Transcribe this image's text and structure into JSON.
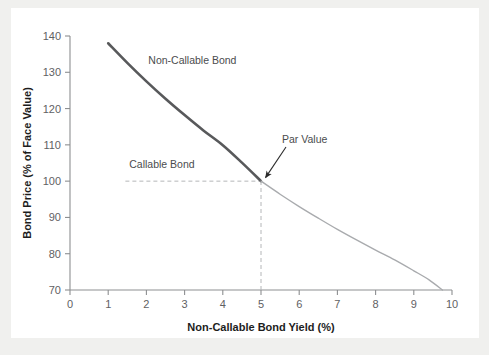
{
  "chart_data": {
    "type": "line",
    "title": "",
    "xlabel": "Non-Callable Bond Yield (%)",
    "ylabel": "Bond Price (% of Face Value)",
    "xlim": [
      0,
      10
    ],
    "ylim": [
      70,
      140
    ],
    "xticks": [
      "0",
      "1",
      "2",
      "3",
      "4",
      "5",
      "6",
      "7",
      "8",
      "9",
      "10"
    ],
    "yticks": [
      "70",
      "80",
      "90",
      "100",
      "110",
      "120",
      "130",
      "140"
    ],
    "grid": false,
    "legend_position": "inline-labels",
    "series": [
      {
        "name": "Non-Callable Bond",
        "color": "#58595b",
        "width": 2.6,
        "x": [
          1.0,
          1.5,
          2.0,
          2.5,
          3.0,
          3.5,
          4.0,
          4.5,
          5.0
        ],
        "y": [
          138.0,
          132.6,
          127.5,
          122.7,
          118.2,
          113.9,
          109.9,
          105.1,
          100.0
        ]
      },
      {
        "name": "Callable Bond",
        "color": "#a9abae",
        "width": 1.4,
        "x": [
          5.0,
          5.5,
          6.0,
          6.5,
          7.0,
          7.5,
          8.0,
          8.5,
          9.0,
          9.4,
          9.75
        ],
        "y": [
          100.0,
          96.4,
          93.0,
          89.8,
          86.7,
          83.8,
          81.0,
          78.3,
          75.3,
          72.8,
          70.0
        ]
      }
    ],
    "reference_lines": [
      {
        "name": "par-value-horizontal",
        "orientation": "horizontal",
        "value": 100,
        "from_x": 1.45,
        "to_x": 5.0,
        "style": "dashed",
        "color": "#b4b6b8"
      },
      {
        "name": "par-value-vertical",
        "orientation": "vertical",
        "value": 5,
        "from_y": 70,
        "to_y": 100,
        "style": "dashed",
        "color": "#b4b6b8"
      }
    ],
    "annotations": [
      {
        "name": "non-callable-bond-label",
        "text": "Non-Callable Bond",
        "x": 2.05,
        "y": 132.4
      },
      {
        "name": "callable-bond-label",
        "text": "Callable Bond",
        "x": 1.55,
        "y": 103.6
      },
      {
        "name": "par-value-label",
        "text": "Par Value",
        "x": 5.55,
        "y": 110.5,
        "arrow_to_x": 5.0,
        "arrow_to_y": 100.0
      }
    ]
  },
  "colors": {
    "figure_background": "#f0f0ee",
    "panel_background": "#ffffff",
    "axis": "#8d8f91",
    "non_callable_line": "#58595b",
    "callable_line": "#a9abae",
    "dashed_guide": "#b4b6b8",
    "tick_text": "#5f6163",
    "axis_title_text": "#1d1d1d",
    "annotation_text": "#4a4c4e"
  }
}
